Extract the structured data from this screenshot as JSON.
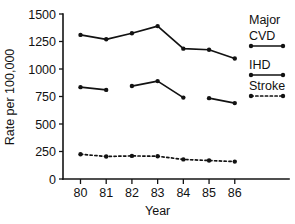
{
  "chart_data": {
    "type": "line",
    "title": "",
    "xlabel": "Year",
    "ylabel": "Rate per 100,000",
    "x": [
      "80",
      "81",
      "82",
      "83",
      "84",
      "85",
      "86"
    ],
    "categories": [
      "80",
      "81",
      "82",
      "83",
      "84",
      "85",
      "86"
    ],
    "xtick_labels": [
      "80",
      "81",
      "82",
      "83",
      "84",
      "85",
      "86"
    ],
    "ytick_labels": [
      "0",
      "250",
      "500",
      "750",
      "1000",
      "1250",
      "1500"
    ],
    "ytick_values": [
      0,
      250,
      500,
      750,
      1000,
      1250,
      1500
    ],
    "ylim": [
      0,
      1500
    ],
    "grid": false,
    "legend_position": "right",
    "series": [
      {
        "name": "Major CVD",
        "legend_label_lines": [
          "Major",
          "CVD"
        ],
        "marker": "filled-circle",
        "linestyle": "solid",
        "color": "#121212",
        "values": [
          1310,
          1270,
          1325,
          1390,
          1185,
          1175,
          1095
        ],
        "segments": [
          [
            0,
            1,
            2,
            3,
            4,
            5,
            6
          ]
        ]
      },
      {
        "name": "IHD",
        "legend_label_lines": [
          "IHD"
        ],
        "marker": "filled-circle",
        "linestyle": "solid",
        "color": "#121212",
        "values": [
          835,
          810,
          845,
          890,
          740,
          735,
          690
        ],
        "segments": [
          [
            0,
            1
          ],
          [
            2,
            3
          ],
          [
            3,
            4
          ],
          [
            5,
            6
          ]
        ]
      },
      {
        "name": "Stroke",
        "legend_label_lines": [
          "Stroke"
        ],
        "marker": "filled-circle",
        "linestyle": "dashed",
        "color": "#121212",
        "values": [
          225,
          205,
          210,
          207,
          178,
          168,
          158
        ],
        "segments": [
          [
            0,
            1,
            2,
            3,
            4,
            5,
            6
          ]
        ]
      }
    ]
  },
  "legend": {
    "entries": [
      {
        "label_line1": "Major",
        "label_line2": "CVD",
        "style": "solid"
      },
      {
        "label_line1": "IHD",
        "label_line2": "",
        "style": "solid"
      },
      {
        "label_line1": "Stroke",
        "label_line2": "",
        "style": "dashed"
      }
    ]
  },
  "axes": {
    "y_title": "Rate per 100,000",
    "x_title": "Year"
  }
}
